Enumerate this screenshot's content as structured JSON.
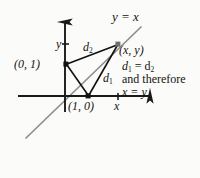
{
  "figure": {
    "background_color": "#fbfbfa",
    "axis_color": "#1a1a1a",
    "diagonal_color": "#8c8c8c",
    "segment_color": "#111111"
  },
  "labels": {
    "line_equation": "y = x",
    "y_axis": "y",
    "x_axis": "x",
    "point_xy": "(x, y)",
    "point_01": "(0, 1)",
    "point_10": "(1, 0)",
    "d1": "d",
    "d1_sub": "1",
    "d2": "d",
    "d2_sub": "2",
    "equality_d": "d",
    "equality_d_sub1": "1",
    "equality_mid": " = d",
    "equality_d_sub2": "2",
    "therefore": "and therefore",
    "equality_xy": "x = y"
  },
  "geometry": {
    "y_axis": {
      "x": 65,
      "y_top": 18,
      "y_bottom": 112
    },
    "x_axis": {
      "y": 96,
      "x_left": 18,
      "x_right": 156
    },
    "diagonal": {
      "x1": 26,
      "y1": 138,
      "x2": 141,
      "y2": 27
    },
    "points": {
      "origin": {
        "x": 65,
        "y": 96
      },
      "p01": {
        "x": 66,
        "y": 64
      },
      "p10": {
        "x": 88,
        "y": 96
      },
      "pxy": {
        "x": 118,
        "y": 44
      }
    },
    "ticks": {
      "y_tick": {
        "x": 65,
        "y": 44
      },
      "x_tick": {
        "x": 118,
        "y": 96
      }
    }
  }
}
